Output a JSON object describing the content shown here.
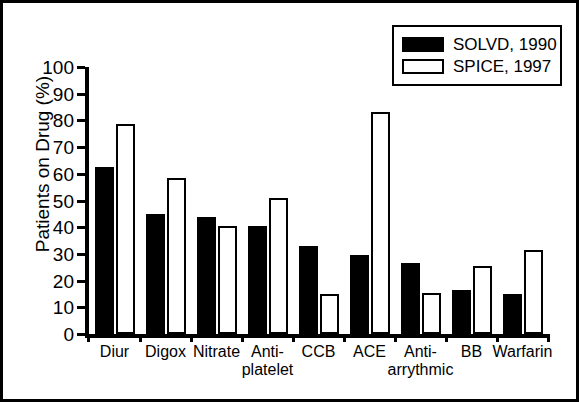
{
  "figure": {
    "background": "#ffffff",
    "frame_color": "#000000"
  },
  "legend": {
    "position": "top-right",
    "entries": [
      {
        "label": "SOLVD, 1990",
        "swatch": "filled-black-square",
        "color": "#000000"
      },
      {
        "label": "SPICE, 1997",
        "swatch": "hollow-white-square",
        "color": "#ffffff"
      }
    ]
  },
  "axis": {
    "y_title": "Patients on Drug (%)",
    "y_ticks": [
      0,
      10,
      20,
      30,
      40,
      50,
      60,
      70,
      80,
      90,
      100
    ],
    "y_min": 0,
    "y_max": 100
  },
  "chart_data": {
    "type": "bar",
    "title": "",
    "xlabel": "",
    "ylabel": "Patients on Drug (%)",
    "ylim": [
      0,
      100
    ],
    "grid": false,
    "legend_position": "top-right",
    "categories": [
      "Diur",
      "Digox",
      "Nitrate",
      "Anti-platelet",
      "CCB",
      "ACE",
      "Anti-arrythmic",
      "BB",
      "Warfarin"
    ],
    "category_lines": [
      [
        "Diur",
        ""
      ],
      [
        "Digox",
        ""
      ],
      [
        "Nitrate",
        ""
      ],
      [
        "Anti-",
        "platelet"
      ],
      [
        "CCB",
        ""
      ],
      [
        "ACE",
        ""
      ],
      [
        "Anti-",
        "arrythmic"
      ],
      [
        "BB",
        ""
      ],
      [
        "Warfarin",
        ""
      ]
    ],
    "series": [
      {
        "name": "SOLVD, 1990",
        "color": "#000000",
        "style": "filled",
        "values": [
          62.5,
          45.0,
          44.0,
          40.5,
          33.0,
          29.5,
          26.5,
          16.5,
          15.0
        ]
      },
      {
        "name": "SPICE, 1997",
        "color": "#ffffff",
        "style": "hollow",
        "values": [
          78.5,
          58.5,
          40.5,
          51.0,
          15.0,
          83.0,
          15.5,
          25.5,
          31.5
        ]
      }
    ]
  }
}
